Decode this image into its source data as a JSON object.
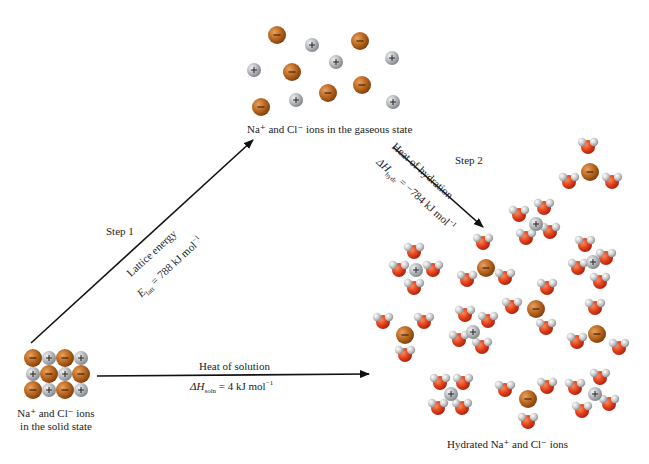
{
  "diagram": {
    "nodes": {
      "solid": {
        "line1": "Na⁺ and Cl⁻ ions",
        "line2": "in the solid state"
      },
      "gaseous": {
        "label": "Na⁺ and Cl⁻ ions in the gaseous state"
      },
      "hydrated": {
        "label": "Hydrated Na⁺ and Cl⁻ ions"
      }
    },
    "steps": {
      "step1": {
        "label": "Step 1",
        "process": "Lattice energy",
        "equation_symbol": "E",
        "equation_sub": "latt",
        "equation_value": " = 788 kJ mol",
        "equation_exp": "−1"
      },
      "step2": {
        "label": "Step 2",
        "process": "Heat of hydration",
        "equation_symbol": "ΔH",
        "equation_sub": "hydr",
        "equation_value": " = −784 kJ mol",
        "equation_exp": "−1"
      },
      "overall": {
        "process": "Heat of solution",
        "equation_symbol": "ΔH",
        "equation_sub": "soln",
        "equation_value": " = 4 kJ mol",
        "equation_exp": "−1"
      }
    },
    "legend": {
      "cation_symbol": "+",
      "anion_symbol": "−"
    },
    "colors": {
      "cation": "#b9bcc0",
      "anion": "#b8661e",
      "oxygen": "#e0401c",
      "hydrogen": "#c8c8c8",
      "arrow": "#111111"
    }
  }
}
